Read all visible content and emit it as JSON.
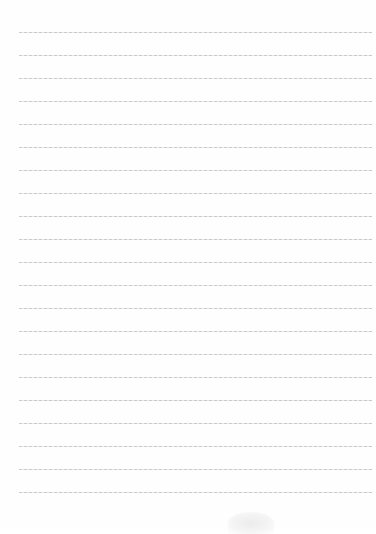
{
  "document": {
    "type": "lined-paper",
    "line_count": 21,
    "first_line_y": 32,
    "line_spacing": 23,
    "line_left": 19,
    "line_right": 372,
    "line_color": "#bdbdbd",
    "background_color": "#fefefe",
    "text": ""
  }
}
